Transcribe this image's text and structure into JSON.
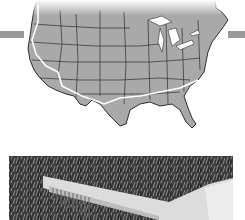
{
  "figure": {
    "map": {
      "subject": "contiguous-united-states-map",
      "style": "grayscale-state-outlines",
      "land_color": "#a9a9a9",
      "border_color": "#2e2e2e",
      "water_color": "#ffffff",
      "route_color": "#ffffff",
      "route": "southern-cross-country-route-california-to-south-carolina"
    },
    "side_bars": {
      "color": "#9a9a9a"
    },
    "photo": {
      "subject": "white-comb-on-grass",
      "style": "grayscale-photo"
    }
  }
}
